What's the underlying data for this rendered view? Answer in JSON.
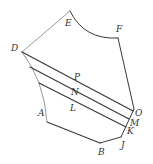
{
  "diagram": {
    "type": "geometric-figure",
    "colors": {
      "dark_stroke": "#3a3a3a",
      "light_stroke": "#9a9a9a",
      "label": "#333333"
    },
    "points": {
      "A": {
        "label": "A",
        "x": 47,
        "y": 122
      },
      "B": {
        "label": "B",
        "x": 100,
        "y": 143
      },
      "J": {
        "label": "J",
        "x": 121,
        "y": 137
      },
      "K": {
        "label": "K",
        "x": 126,
        "y": 127
      },
      "M": {
        "label": "M",
        "x": 129,
        "y": 119
      },
      "O": {
        "label": "O",
        "x": 133,
        "y": 111
      },
      "F": {
        "label": "F",
        "x": 118,
        "y": 38
      },
      "E": {
        "label": "E",
        "x": 70,
        "y": 11
      },
      "D": {
        "label": "D",
        "x": 22,
        "y": 52
      },
      "P": {
        "label": "P"
      },
      "N": {
        "label": "N"
      },
      "L": {
        "label": "L"
      }
    },
    "labels": {
      "A": "A",
      "B": "B",
      "J": "J",
      "K": "K",
      "M": "M",
      "O": "O",
      "F": "F",
      "E": "E",
      "D": "D",
      "P": "P",
      "N": "N",
      "L": "L"
    }
  }
}
